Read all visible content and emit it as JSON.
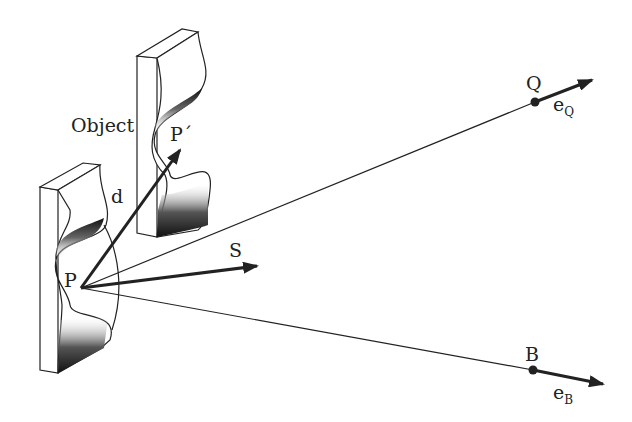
{
  "diagram": {
    "type": "vector geometry / scattering diagram",
    "labels": {
      "object": "Object",
      "d": "d",
      "p": "P",
      "p_prime": "P´",
      "s": "S",
      "q": "Q",
      "e_q_base": "e",
      "e_q_sub": "Q",
      "b": "B",
      "e_b_base": "e",
      "e_b_sub": "B"
    },
    "points": {
      "P": [
        81,
        288
      ],
      "P_prime": [
        180,
        150
      ],
      "S_tip": [
        257,
        266
      ],
      "Q": [
        535,
        102
      ],
      "Q_arrow_tip": [
        592,
        80
      ],
      "B": [
        533,
        370
      ],
      "B_arrow_tip": [
        603,
        384
      ]
    },
    "colors": {
      "ink": "#222222",
      "background": "#ffffff"
    }
  }
}
